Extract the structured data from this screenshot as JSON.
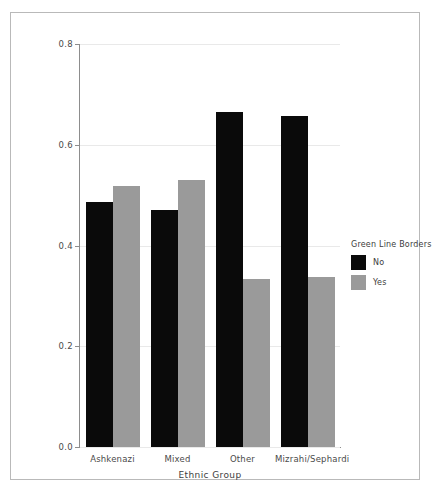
{
  "chart_data": {
    "type": "bar",
    "title": "",
    "xlabel": "Ethnic Group",
    "ylabel": "Proportion",
    "categories": [
      "Ashkenazi",
      "Mixed",
      "Other",
      "Mizrahi/Sephardi"
    ],
    "series": [
      {
        "name": "No",
        "color": "#0a0a0a",
        "values": [
          0.486,
          0.47,
          0.665,
          0.657
        ]
      },
      {
        "name": "Yes",
        "color": "#9a9a9a",
        "values": [
          0.519,
          0.53,
          0.333,
          0.338
        ]
      }
    ],
    "legend": {
      "title": "Green Line Borders",
      "position": "right",
      "entries": [
        "No",
        "Yes"
      ]
    },
    "ylim": [
      0.0,
      0.8
    ],
    "yticks": [
      "0.0",
      "0.2",
      "0.4",
      "0.6",
      "0.8"
    ],
    "ytick_values": [
      0.0,
      0.2,
      0.4,
      0.6,
      0.8
    ],
    "grid": true,
    "grid_axis": "y"
  },
  "axes": {
    "ytick_0": "0.0",
    "ytick_1": "0.2",
    "ytick_2": "0.4",
    "ytick_3": "0.6",
    "ytick_4": "0.8",
    "xlabel": "Ethnic Group",
    "ylabel": "Proportion",
    "xtick_0": "Ashkenazi",
    "xtick_1": "Mixed",
    "xtick_2": "Other",
    "xtick_3": "Mizrahi/Sephardi"
  },
  "legend": {
    "title": "Green Line Borders",
    "item_0": "No",
    "item_1": "Yes"
  },
  "colors": {
    "series_no": "#0a0a0a",
    "series_yes": "#9a9a9a",
    "grid": "#e9e9e9",
    "axis": "#8d8d8d",
    "frame": "#b9b9b9",
    "text": "#3d3d3d"
  }
}
